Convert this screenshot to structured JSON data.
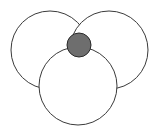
{
  "diagram": {
    "width": 159,
    "height": 134,
    "background": "#ffffff",
    "stroke_color": "#3a3a3a",
    "circles": [
      {
        "name": "left-circle",
        "cx": 50,
        "cy": 50,
        "r": 39,
        "fill": "#ffffff"
      },
      {
        "name": "right-circle",
        "cx": 109,
        "cy": 50,
        "r": 39,
        "fill": "#ffffff"
      },
      {
        "name": "bottom-circle",
        "cx": 78,
        "cy": 86,
        "r": 39,
        "fill": "#ffffff"
      },
      {
        "name": "center-dot",
        "cx": 79,
        "cy": 45,
        "r": 12,
        "fill": "#6e6e6e"
      }
    ]
  }
}
